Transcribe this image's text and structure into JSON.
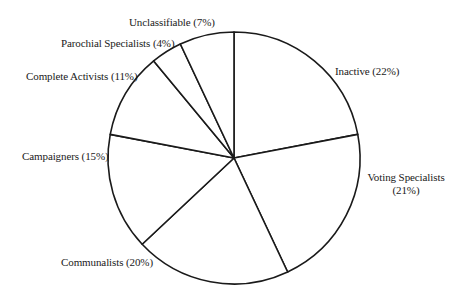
{
  "chart_data": {
    "type": "pie",
    "title": "",
    "categories": [
      "Inactive",
      "Voting Specialists",
      "Communalists",
      "Campaigners",
      "Complete Activists",
      "Parochial Specialists",
      "Unclassifiable"
    ],
    "values": [
      22,
      21,
      20,
      15,
      11,
      4,
      7
    ],
    "unit": "%",
    "start_angle_deg": 90,
    "direction": "clockwise",
    "colors": {
      "fill": "#ffffff",
      "stroke": "#1a1a1a"
    },
    "legend": "none (labels placed beside slices)"
  },
  "labels": {
    "inactive": "Inactive (22%)",
    "voting_line1": "Voting Specialists",
    "voting_line2": "(21%)",
    "communalists": "Communalists (20%)",
    "campaigners": "Campaigners (15%)",
    "complete_activists": "Complete Activists (11%)",
    "parochial_specialists": "Parochial Specialists (4%)",
    "unclassifiable": "Unclassifiable (7%)"
  }
}
